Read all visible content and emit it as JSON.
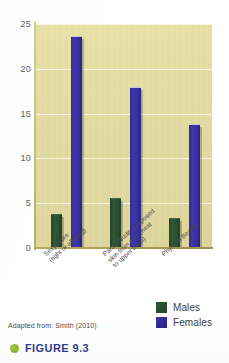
{
  "chart_data": {
    "type": "bar",
    "title": "",
    "subtitle": "",
    "xlabel": "",
    "ylabel": "",
    "ylim": [
      0,
      25
    ],
    "yticks": [
      0,
      5,
      10,
      15,
      20,
      25
    ],
    "ytick_labels": [
      "0",
      "5",
      "10",
      "15",
      "20",
      "25"
    ],
    "grid": true,
    "grid_axis": "y",
    "legend_position": "bottom-right",
    "categories": [
      "Sexy Attire (tight or alluring)",
      "Partial Nudity (exposed skin from mid chest to upper thigh)",
      "Physical Beauty"
    ],
    "category_lines": [
      [
        "Sexy Attire",
        "(tight or alluring)"
      ],
      [
        "Partial Nudity (exposed",
        "skin from mid chest",
        "to upper thigh)"
      ],
      [
        "Physical Beauty"
      ]
    ],
    "series": [
      {
        "name": "Males",
        "color": "#2e5836",
        "values": [
          3.8,
          5.6,
          3.3
        ]
      },
      {
        "name": "Females",
        "color": "#3a2fa0",
        "values": [
          23.7,
          18.0,
          13.8
        ]
      }
    ],
    "plot_background_color": "#e3dca0",
    "gridline_color": "#f7f4e2"
  },
  "legend": {
    "items": [
      {
        "label": "Males",
        "color": "#2e5836"
      },
      {
        "label": "Females",
        "color": "#3a2fa0"
      }
    ]
  },
  "source_note": "Adapted from: Smith (2010)",
  "caption": {
    "text": "FIGURE 9.3",
    "bullet_color": "#8cba33",
    "text_color": "#2f3d8c"
  }
}
